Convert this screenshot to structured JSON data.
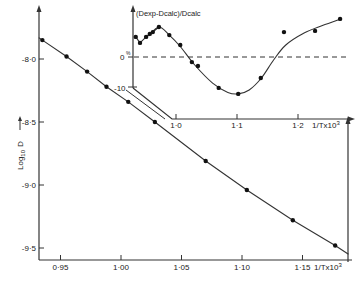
{
  "chart_data": [
    {
      "type": "line",
      "title": "",
      "xlabel": "1/T x 10^3",
      "ylabel": "Log10 D",
      "xlim": [
        0.925,
        1.19
      ],
      "ylim": [
        -9.6,
        -7.75
      ],
      "x_ticks": [
        0.95,
        1.0,
        1.05,
        1.1,
        1.15
      ],
      "x_tick_labels": [
        "0·95",
        "1·00",
        "1·05",
        "1·10",
        "1·15"
      ],
      "y_ticks": [
        -8.0,
        -8.5,
        -9.0,
        -9.5
      ],
      "y_tick_labels": [
        "-8·0",
        "-8·5",
        "-9·0",
        "-9·5"
      ],
      "grid": false,
      "series": [
        {
          "name": "experimental",
          "x": [
            0.935,
            0.955,
            0.972,
            0.988,
            1.006,
            1.028,
            1.07,
            1.104,
            1.142,
            1.177
          ],
          "y": [
            -7.85,
            -7.98,
            -8.1,
            -8.22,
            -8.34,
            -8.5,
            -8.81,
            -9.04,
            -9.28,
            -9.48
          ]
        }
      ]
    },
    {
      "type": "line",
      "title": "",
      "inset": true,
      "xlabel": "1/T x 10^3",
      "ylabel": "(Dexp-Dcalc)/Dcalc",
      "y_unit": "%",
      "xlim": [
        0.93,
        1.29
      ],
      "ylim": [
        -10,
        15
      ],
      "x_ticks": [
        1.0,
        1.1,
        1.2
      ],
      "x_tick_labels": [
        "1·0",
        "1·1",
        "1·2"
      ],
      "y_ticks": [
        0,
        -10
      ],
      "y_tick_labels": [
        "0",
        "-10"
      ],
      "reference_line": {
        "y": 0,
        "style": "dashed"
      },
      "grid": false,
      "series": [
        {
          "name": "deviation",
          "x": [
            0.934,
            0.941,
            0.951,
            0.957,
            0.962,
            0.972,
            0.989,
            1.007,
            1.026,
            1.036,
            1.07,
            1.102,
            1.139,
            1.177,
            1.228,
            1.269
          ],
          "y": [
            6.7,
            4.7,
            6.7,
            7.7,
            8.3,
            10.0,
            7.3,
            4.0,
            -1.7,
            -3.0,
            -10.3,
            -12.3,
            -7.0,
            8.3,
            8.7,
            12.7
          ]
        }
      ],
      "fitted_curve": {
        "x": [
          0.955,
          0.972,
          0.989,
          1.007,
          1.03,
          1.06,
          1.085,
          1.102,
          1.12,
          1.14,
          1.16,
          1.18,
          1.21,
          1.24,
          1.27
        ],
        "y": [
          7.0,
          10.0,
          7.3,
          3.5,
          -2.5,
          -8.7,
          -11.8,
          -12.3,
          -11.0,
          -7.0,
          -1.0,
          4.0,
          8.0,
          10.5,
          12.7
        ]
      }
    }
  ],
  "labels": {
    "main_ylabel": "Log",
    "main_ylabel_sub": "10",
    "main_ylabel_var": "D",
    "main_xlabel": "1/Tx10",
    "main_xlabel_sup": "3",
    "inset_ylabel": "(Dexp-Dcalc)/Dcalc",
    "inset_percent": "%",
    "inset_xlabel": "1/Tx10",
    "inset_xlabel_sup": "3"
  }
}
